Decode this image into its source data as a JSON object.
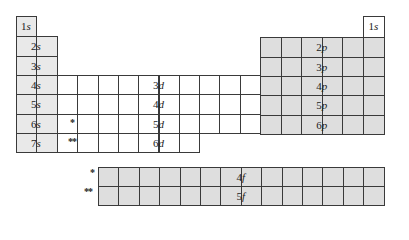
{
  "diagram": {
    "title": "",
    "type": "periodic-table-orbital-blocks",
    "colors": {
      "line": "#3a3a3a",
      "s_block": "#e9e9e9",
      "d_block": "#ffffff",
      "p_block": "#dedede",
      "f_block": "#dedede",
      "h_right": "#ffffff"
    },
    "s_block": {
      "labels": [
        "1s",
        "2s",
        "3s",
        "4s",
        "5s",
        "6s",
        "7s"
      ]
    },
    "h_right": {
      "label": "1s"
    },
    "d_block": {
      "labels": [
        "3d",
        "4d",
        "5d",
        "6d"
      ],
      "markers": {
        "row6": "*",
        "row7": "**"
      }
    },
    "p_block": {
      "labels": [
        "2p",
        "3p",
        "4p",
        "5p",
        "6p"
      ]
    },
    "f_block": {
      "labels": [
        "4f",
        "5f"
      ],
      "markers": {
        "row1": "*",
        "row2": "**"
      }
    }
  }
}
